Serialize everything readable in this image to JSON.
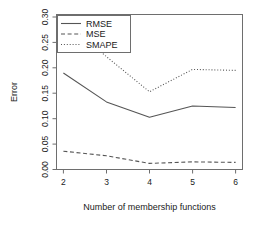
{
  "chart_data": {
    "type": "line",
    "title": "",
    "xlabel": "Number of membership functions",
    "ylabel": "Error",
    "x": [
      2,
      3,
      4,
      5,
      6
    ],
    "xlim": [
      1.84,
      6.16
    ],
    "ylim": [
      0.0,
      0.305
    ],
    "xticks": [
      "2",
      "3",
      "4",
      "5",
      "6"
    ],
    "yticks": [
      "0.00",
      "0.05",
      "0.10",
      "0.15",
      "0.20",
      "0.25",
      "0.30"
    ],
    "ytick_values": [
      0.0,
      0.05,
      0.1,
      0.15,
      0.2,
      0.25,
      0.3
    ],
    "grid": false,
    "legend_position": "top-left",
    "series": [
      {
        "name": "RMSE",
        "style": "solid",
        "values": [
          0.19,
          0.133,
          0.103,
          0.125,
          0.122
        ]
      },
      {
        "name": "MSE",
        "style": "dashed",
        "values": [
          0.036,
          0.027,
          0.012,
          0.015,
          0.014
        ]
      },
      {
        "name": "SMAPE",
        "style": "dotted",
        "values": [
          0.295,
          0.222,
          0.153,
          0.197,
          0.195
        ]
      }
    ]
  },
  "axis": {
    "y_label": "Error",
    "x_label": "Number of membership functions",
    "x_tick_labels": [
      "2",
      "3",
      "4",
      "5",
      "6"
    ],
    "y_tick_labels": [
      "0.00",
      "0.05",
      "0.10",
      "0.15",
      "0.20",
      "0.25",
      "0.30"
    ]
  },
  "legend": {
    "entries": [
      {
        "label": "RMSE"
      },
      {
        "label": "MSE"
      },
      {
        "label": "SMAPE"
      }
    ]
  }
}
